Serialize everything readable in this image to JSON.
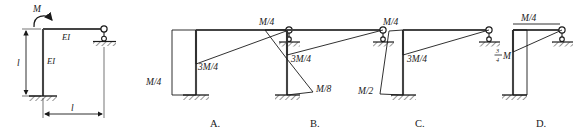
{
  "figure": {
    "line_color": "#1a1a1a",
    "member_color": "#444444",
    "hatch_color": "#1a1a1a"
  },
  "given_frame": {
    "name": "given-structure",
    "moment_label": "M",
    "stiffness_label_vertical": "EI",
    "stiffness_label_horizontal": "EI",
    "dim_vertical_label": "l",
    "dim_horizontal_label": "l",
    "support_base": "fixed-support",
    "support_right": "roller-support"
  },
  "options": [
    {
      "key": "A",
      "letter": "A.",
      "labels": [
        {
          "name": "beam-moment-value",
          "text": "3M/4"
        },
        {
          "name": "column-moment-value",
          "text": "M/4"
        }
      ],
      "column_diagram_shape": "rectangle-constant",
      "beam_diagram_shape": "triangle-tapering-to-roller"
    },
    {
      "key": "B",
      "letter": "B.",
      "labels": [
        {
          "name": "column-top-moment-value",
          "text": "M/4"
        },
        {
          "name": "beam-moment-value",
          "text": "3M/4"
        },
        {
          "name": "column-bottom-moment-value",
          "text": "M/8"
        }
      ],
      "column_diagram_shape": "crossing-triangles",
      "beam_diagram_shape": "triangle-tapering-to-roller"
    },
    {
      "key": "C",
      "letter": "C.",
      "labels": [
        {
          "name": "column-top-moment-value",
          "text": "M/4"
        },
        {
          "name": "beam-moment-value",
          "text": "3M/4"
        },
        {
          "name": "column-bottom-moment-value",
          "text": "M/2"
        }
      ],
      "column_diagram_shape": "trapezoid-widening-downward",
      "beam_diagram_shape": "triangle-tapering-to-roller"
    },
    {
      "key": "D",
      "letter": "D.",
      "labels": [
        {
          "name": "beam-moment-value",
          "text": "M/4"
        },
        {
          "name": "column-moment-value-numerator",
          "text": "3"
        },
        {
          "name": "column-moment-value-denominator",
          "text": "4"
        },
        {
          "name": "column-moment-value-symbol",
          "text": "M"
        }
      ],
      "column_diagram_shape": "rectangle-constant",
      "beam_diagram_shape": "triangle-tapering-to-roller"
    }
  ]
}
